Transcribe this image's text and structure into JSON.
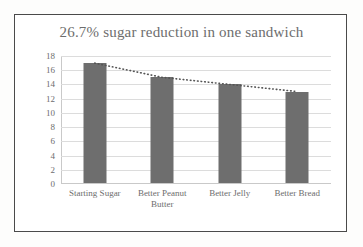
{
  "chart_data": {
    "type": "bar",
    "title": "26.7% sugar reduction in one sandwich",
    "categories": [
      "Starting Sugar",
      "Better Peanut Butter",
      "Better Jelly",
      "Better Bread"
    ],
    "values": [
      17,
      15,
      14,
      13
    ],
    "series": [
      {
        "name": "Sugar (grams)",
        "type": "bar",
        "values": [
          17,
          15,
          14,
          13
        ]
      },
      {
        "name": "Trendline",
        "type": "line",
        "style": "dotted",
        "values": [
          17,
          15,
          14,
          13
        ]
      }
    ],
    "xlabel": "",
    "ylabel": "",
    "ylim": [
      0,
      18
    ],
    "ytick_step": 2,
    "yticks": [
      18,
      16,
      14,
      12,
      10,
      8,
      6,
      4,
      2,
      0
    ],
    "grid": true,
    "legend": false,
    "colors": {
      "bar": "#6e6e6e",
      "gridline": "#dcdcdc",
      "trendline": "#555555",
      "title_text": "#6d6d6d",
      "tick_text": "#6d6d6d",
      "frame_border": "#4a4a4a",
      "background": "#ffffff"
    }
  }
}
